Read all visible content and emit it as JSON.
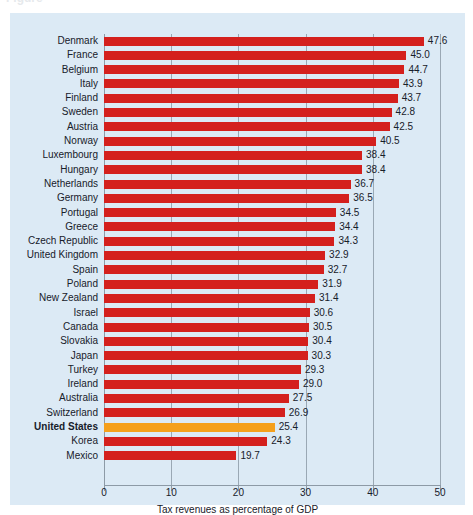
{
  "figure": {
    "ghost_title": "Figure",
    "panel_color": "#dceaf5",
    "bar_color": "#d4201d",
    "highlight_color": "#f5a01c",
    "gridline_color": "#9aa8b4"
  },
  "chart_data": {
    "type": "bar",
    "orientation": "horizontal",
    "title": "",
    "xlabel": "Tax revenues as percentage of GDP",
    "ylabel": "",
    "xlim": [
      0,
      50
    ],
    "xticks": [
      0,
      10,
      20,
      30,
      40,
      50
    ],
    "xtick_labels": [
      "0",
      "10",
      "20",
      "30",
      "40",
      "50"
    ],
    "grid": true,
    "legend": "none",
    "highlight_category": "United States",
    "categories": [
      "Denmark",
      "France",
      "Belgium",
      "Italy",
      "Finland",
      "Sweden",
      "Austria",
      "Norway",
      "Luxembourg",
      "Hungary",
      "Netherlands",
      "Germany",
      "Portugal",
      "Greece",
      "Czech Republic",
      "United Kingdom",
      "Spain",
      "Poland",
      "New Zealand",
      "Israel",
      "Canada",
      "Slovakia",
      "Japan",
      "Turkey",
      "Ireland",
      "Australia",
      "Switzerland",
      "United States",
      "Korea",
      "Mexico"
    ],
    "values": [
      47.6,
      45.0,
      44.7,
      43.9,
      43.7,
      42.8,
      42.5,
      40.5,
      38.4,
      38.4,
      36.7,
      36.5,
      34.5,
      34.4,
      34.3,
      32.9,
      32.7,
      31.9,
      31.4,
      30.6,
      30.5,
      30.4,
      30.3,
      29.3,
      29.0,
      27.5,
      26.9,
      25.4,
      24.3,
      19.7
    ],
    "value_labels": [
      "47.6",
      "45.0",
      "44.7",
      "43.9",
      "43.7",
      "42.8",
      "42.5",
      "40.5",
      "38.4",
      "38.4",
      "36.7",
      "36.5",
      "34.5",
      "34.4",
      "34.3",
      "32.9",
      "32.7",
      "31.9",
      "31.4",
      "30.6",
      "30.5",
      "30.4",
      "30.3",
      "29.3",
      "29.0",
      "27.5",
      "26.9",
      "25.4",
      "24.3",
      "19.7"
    ]
  }
}
